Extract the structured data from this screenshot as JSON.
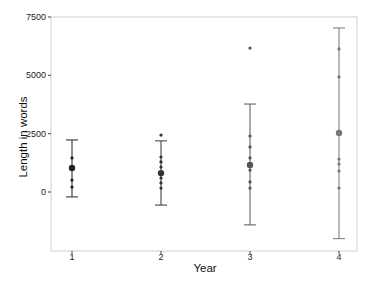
{
  "chart_data": {
    "type": "scatter",
    "subtype": "mean_with_error_bars_and_jittered_points",
    "title": "",
    "xlabel": "Year",
    "ylabel": "Length in words",
    "categories": [
      "1",
      "2",
      "3",
      "4"
    ],
    "y_ticks": [
      0,
      2500,
      5000,
      7500
    ],
    "y_tick_labels": [
      "0",
      "2500",
      "5000",
      "7500"
    ],
    "ylim": [
      -2500,
      7500
    ],
    "grid": false,
    "legend": null,
    "groups": [
      {
        "year": "1",
        "color": "#222222",
        "mean": 1030,
        "error_upper": 2230,
        "error_lower": -210,
        "points": [
          1460,
          1030,
          510,
          210
        ]
      },
      {
        "year": "2",
        "color": "#333333",
        "mean": 810,
        "error_upper": 2190,
        "error_lower": -560,
        "points": [
          2440,
          1500,
          1290,
          1070,
          810,
          600,
          390,
          170
        ]
      },
      {
        "year": "3",
        "color": "#555555",
        "mean": 1160,
        "error_upper": 3770,
        "error_lower": -1410,
        "points": [
          6170,
          2400,
          1930,
          1460,
          940,
          430,
          170
        ]
      },
      {
        "year": "4",
        "color": "#777777",
        "mean": 2530,
        "error_upper": 7030,
        "error_lower": -2000,
        "points": [
          6130,
          4930,
          1410,
          1200,
          900,
          170
        ]
      }
    ]
  }
}
